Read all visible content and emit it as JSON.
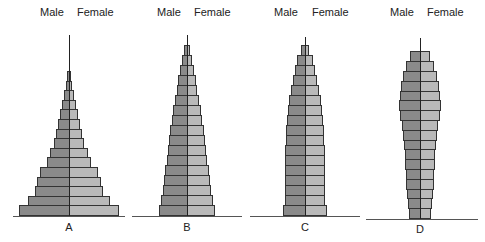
{
  "chart_data": [
    {
      "type": "bar",
      "subtype": "population-pyramid",
      "label": "A",
      "legend": [
        "Male",
        "Female"
      ],
      "shape": "expansive (broad base, rapidly narrowing top)",
      "age_groups_bottom_to_top": 15,
      "male_values": [
        50,
        41,
        34,
        32,
        29,
        22,
        19,
        15,
        13,
        11,
        9,
        7,
        5,
        3,
        2
      ],
      "female_values": [
        50,
        41,
        34,
        32,
        29,
        22,
        19,
        15,
        13,
        11,
        9,
        7,
        5,
        3,
        2
      ],
      "xlabel": "",
      "ylabel": "",
      "grid": false
    },
    {
      "type": "bar",
      "subtype": "population-pyramid",
      "label": "B",
      "legend": [
        "Male",
        "Female"
      ],
      "shape": "expansive / triangular",
      "age_groups_bottom_to_top": 17,
      "male_values": [
        28,
        26,
        24,
        23,
        22,
        20,
        19,
        18,
        17,
        15,
        14,
        12,
        10,
        9,
        7,
        5,
        3
      ],
      "female_values": [
        28,
        26,
        24,
        23,
        22,
        20,
        19,
        18,
        17,
        15,
        14,
        12,
        10,
        9,
        7,
        5,
        3
      ],
      "xlabel": "",
      "ylabel": "",
      "grid": false
    },
    {
      "type": "bar",
      "subtype": "population-pyramid",
      "label": "C",
      "legend": [
        "Male",
        "Female"
      ],
      "shape": "stationary (near-column base, tapering top)",
      "age_groups_bottom_to_top": 17,
      "male_values": [
        22,
        20,
        20,
        20,
        20,
        20,
        20,
        19,
        19,
        18,
        17,
        16,
        14,
        12,
        10,
        8,
        4
      ],
      "female_values": [
        22,
        20,
        20,
        20,
        20,
        20,
        20,
        19,
        19,
        18,
        17,
        16,
        14,
        12,
        10,
        8,
        4
      ],
      "xlabel": "",
      "ylabel": "",
      "grid": false
    },
    {
      "type": "bar",
      "subtype": "population-pyramid",
      "label": "D",
      "legend": [
        "Male",
        "Female"
      ],
      "shape": "constrictive (narrow base, bulge in middle ages)",
      "age_groups_bottom_to_top": 17,
      "male_values": [
        11,
        12,
        13,
        14,
        14,
        15,
        15,
        16,
        17,
        18,
        20,
        21,
        20,
        19,
        17,
        14,
        10
      ],
      "female_values": [
        11,
        12,
        13,
        14,
        14,
        15,
        15,
        16,
        17,
        18,
        20,
        21,
        20,
        19,
        17,
        14,
        10
      ],
      "xlabel": "",
      "ylabel": "",
      "grid": false
    }
  ],
  "pyramids": [
    {
      "id": "A",
      "male_label": "Male",
      "female_label": "Female",
      "letter": "A"
    },
    {
      "id": "B",
      "male_label": "Male",
      "female_label": "Female",
      "letter": "B"
    },
    {
      "id": "C",
      "male_label": "Male",
      "female_label": "Female",
      "letter": "C"
    },
    {
      "id": "D",
      "male_label": "Male",
      "female_label": "Female",
      "letter": "D"
    }
  ],
  "colors": {
    "male": "#8a8a8a",
    "female": "#b9b9b9",
    "outline": "#333333"
  }
}
